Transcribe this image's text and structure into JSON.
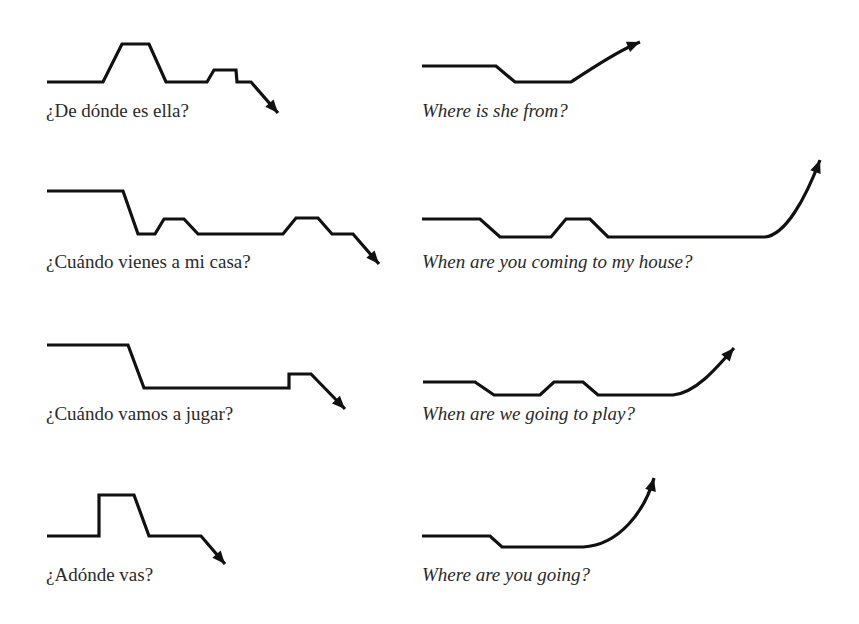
{
  "figure": {
    "colors": {
      "ink": "#111111",
      "text": "#2a2a2a",
      "background": "#ffffff"
    },
    "items": [
      {
        "id": "es-1",
        "language": "Spanish",
        "sentence": "¿De dónde es ella?",
        "final": "falling",
        "caption_pos": [
          46,
          101
        ],
        "points": [
          [
            47,
            82
          ],
          [
            103,
            82
          ],
          [
            122,
            44
          ],
          [
            149,
            44
          ],
          [
            166,
            82
          ],
          [
            207,
            82
          ],
          [
            214,
            70
          ],
          [
            236,
            70
          ],
          [
            237,
            82
          ],
          [
            251,
            82
          ],
          [
            278,
            113
          ]
        ],
        "curve_end": null
      },
      {
        "id": "en-1",
        "language": "English",
        "sentence": "Where is she from?",
        "final": "rising",
        "caption_pos": [
          422,
          101
        ],
        "points": [
          [
            422,
            66
          ],
          [
            496,
            66
          ],
          [
            515,
            82
          ],
          [
            571,
            82
          ]
        ],
        "curve_end": {
          "c1": [
            590,
            70
          ],
          "c2": [
            615,
            52
          ],
          "end": [
            640,
            42
          ]
        }
      },
      {
        "id": "es-2",
        "language": "Spanish",
        "sentence": "¿Cuándo vienes a mi casa?",
        "final": "falling",
        "caption_pos": [
          46,
          252
        ],
        "points": [
          [
            47,
            191
          ],
          [
            123,
            191
          ],
          [
            138,
            234
          ],
          [
            155,
            234
          ],
          [
            164,
            219
          ],
          [
            184,
            219
          ],
          [
            198,
            234
          ],
          [
            283,
            234
          ],
          [
            296,
            218
          ],
          [
            318,
            218
          ],
          [
            332,
            234
          ],
          [
            353,
            234
          ],
          [
            379,
            264
          ]
        ],
        "curve_end": null
      },
      {
        "id": "en-2",
        "language": "English",
        "sentence": "When are you coming to my house?",
        "final": "rising",
        "caption_pos": [
          422,
          252
        ],
        "points": [
          [
            422,
            219
          ],
          [
            480,
            219
          ],
          [
            500,
            237
          ],
          [
            551,
            237
          ],
          [
            566,
            219
          ],
          [
            590,
            219
          ],
          [
            608,
            237
          ],
          [
            765,
            237
          ]
        ],
        "curve_end": {
          "c1": [
            785,
            235
          ],
          "c2": [
            805,
            200
          ],
          "end": [
            820,
            160
          ]
        }
      },
      {
        "id": "es-3",
        "language": "Spanish",
        "sentence": "¿Cuándo vamos a jugar?",
        "final": "falling",
        "caption_pos": [
          46,
          404
        ],
        "points": [
          [
            47,
            345
          ],
          [
            128,
            345
          ],
          [
            144,
            388
          ],
          [
            289,
            388
          ],
          [
            289,
            374
          ],
          [
            311,
            374
          ],
          [
            345,
            409
          ]
        ],
        "curve_end": null
      },
      {
        "id": "en-3",
        "language": "English",
        "sentence": "When are we going to play?",
        "final": "rising",
        "caption_pos": [
          422,
          404
        ],
        "points": [
          [
            423,
            382
          ],
          [
            475,
            382
          ],
          [
            494,
            395
          ],
          [
            540,
            395
          ],
          [
            554,
            382
          ],
          [
            583,
            382
          ],
          [
            598,
            395
          ],
          [
            673,
            395
          ]
        ],
        "curve_end": {
          "c1": [
            695,
            393
          ],
          "c2": [
            715,
            370
          ],
          "end": [
            734,
            348
          ]
        }
      },
      {
        "id": "es-4",
        "language": "Spanish",
        "sentence": "¿Adónde vas?",
        "final": "falling",
        "caption_pos": [
          46,
          565
        ],
        "points": [
          [
            47,
            536
          ],
          [
            99,
            536
          ],
          [
            99,
            495
          ],
          [
            134,
            495
          ],
          [
            149,
            536
          ],
          [
            201,
            536
          ],
          [
            225,
            564
          ]
        ],
        "curve_end": null
      },
      {
        "id": "en-4",
        "language": "English",
        "sentence": "Where are you going?",
        "final": "rising",
        "caption_pos": [
          422,
          565
        ],
        "points": [
          [
            422,
            536
          ],
          [
            490,
            536
          ],
          [
            502,
            547
          ],
          [
            583,
            547
          ]
        ],
        "curve_end": {
          "c1": [
            620,
            545
          ],
          "c2": [
            645,
            510
          ],
          "end": [
            654,
            478
          ]
        }
      }
    ]
  }
}
